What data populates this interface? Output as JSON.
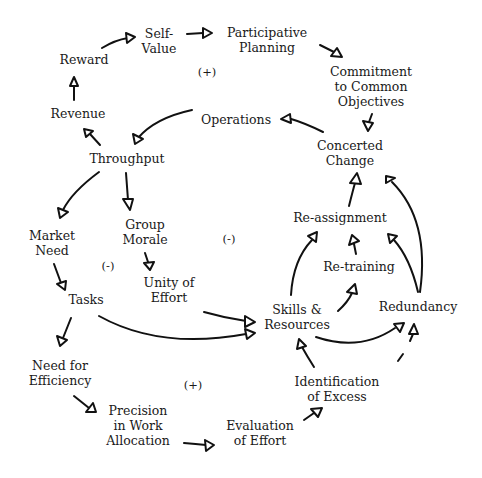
{
  "diagram": {
    "type": "causal-loop-diagram",
    "nodes": {
      "self_value": {
        "l1": "Self-",
        "l2": "Value"
      },
      "participative_planning": {
        "l1": "Participative",
        "l2": "Planning"
      },
      "reward": {
        "l1": "Reward"
      },
      "commitment": {
        "l1": "Commitment",
        "l2": "to Common",
        "l3": "Objectives"
      },
      "revenue": {
        "l1": "Revenue"
      },
      "operations": {
        "l1": "Operations"
      },
      "concerted_change": {
        "l1": "Concerted",
        "l2": "Change"
      },
      "throughput": {
        "l1": "Throughput"
      },
      "group_morale": {
        "l1": "Group",
        "l2": "Morale"
      },
      "market_need": {
        "l1": "Market",
        "l2": "Need"
      },
      "reassignment": {
        "l1": "Re-assignment"
      },
      "retraining": {
        "l1": "Re-training"
      },
      "unity_of_effort": {
        "l1": "Unity of",
        "l2": "Effort"
      },
      "tasks": {
        "l1": "Tasks"
      },
      "skills_resources": {
        "l1": "Skills &",
        "l2": "Resources"
      },
      "redundancy": {
        "l1": "Redundancy"
      },
      "need_for_efficiency": {
        "l1": "Need for",
        "l2": "Efficiency"
      },
      "identification_of_excess": {
        "l1": "Identification",
        "l2": "of Excess"
      },
      "precision": {
        "l1": "Precision",
        "l2": "in Work",
        "l3": "Allocation"
      },
      "evaluation_of_effort": {
        "l1": "Evaluation",
        "l2": "of Effort"
      }
    },
    "loop_signs": {
      "top": "(+)",
      "middle_left": "(-)",
      "middle_right": "(-)",
      "bottom": "(+)"
    },
    "edges": [
      [
        "Reward",
        "Self-Value"
      ],
      [
        "Self-Value",
        "Participative Planning"
      ],
      [
        "Participative Planning",
        "Commitment to Common Objectives"
      ],
      [
        "Commitment to Common Objectives",
        "Concerted Change"
      ],
      [
        "Concerted Change",
        "Operations"
      ],
      [
        "Operations",
        "Throughput"
      ],
      [
        "Throughput",
        "Revenue"
      ],
      [
        "Revenue",
        "Reward"
      ],
      [
        "Throughput",
        "Market Need"
      ],
      [
        "Throughput",
        "Group Morale"
      ],
      [
        "Group Morale",
        "Unity of Effort"
      ],
      [
        "Unity of Effort",
        "Skills & Resources"
      ],
      [
        "Market Need",
        "Tasks"
      ],
      [
        "Tasks",
        "Skills & Resources"
      ],
      [
        "Tasks",
        "Need for Efficiency"
      ],
      [
        "Need for Efficiency",
        "Precision in Work Allocation"
      ],
      [
        "Precision in Work Allocation",
        "Evaluation of Effort"
      ],
      [
        "Evaluation of Effort",
        "Identification of Excess"
      ],
      [
        "Identification of Excess",
        "Skills & Resources"
      ],
      [
        "Identification of Excess",
        "Redundancy"
      ],
      [
        "Skills & Resources",
        "Redundancy"
      ],
      [
        "Skills & Resources",
        "Re-assignment"
      ],
      [
        "Skills & Resources",
        "Re-training"
      ],
      [
        "Re-training",
        "Re-assignment"
      ],
      [
        "Redundancy",
        "Re-assignment"
      ],
      [
        "Redundancy",
        "Concerted Change"
      ],
      [
        "Re-assignment",
        "Concerted Change"
      ]
    ]
  }
}
